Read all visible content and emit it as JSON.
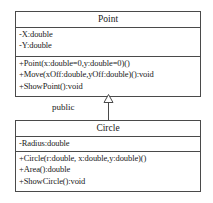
{
  "diagram": {
    "type": "uml-class-diagram",
    "classes": [
      {
        "name": "Point",
        "attributes": [
          "-X:double",
          "-Y:double"
        ],
        "operations": [
          "+Point(x:double=0,y:double=0)()",
          "+Move(xOff:double,yOff:double)():void",
          "+ShowPoint():void"
        ]
      },
      {
        "name": "Circle",
        "attributes": [
          "-Radius:double"
        ],
        "operations": [
          "+Circle(r:double, x:double,y:double)()",
          "+Area():double",
          "+ShowCircle():void"
        ]
      }
    ],
    "relationship": {
      "label": "public",
      "kind": "generalization",
      "from": "Circle",
      "to": "Point",
      "arrowhead": "hollow-triangle"
    },
    "colors": {
      "line": "#4a4a4a",
      "text": "#1a1a1a",
      "background": "#ffffff"
    }
  }
}
